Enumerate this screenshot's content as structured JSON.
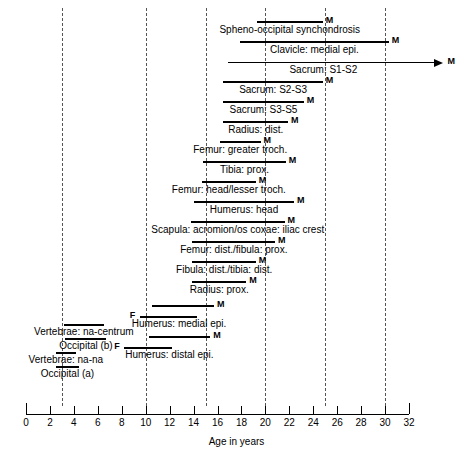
{
  "chart_data": {
    "type": "bar",
    "title": "",
    "xlabel": "Age in years",
    "ylabel": "",
    "xlim": [
      0,
      32
    ],
    "xticks": [
      0,
      2,
      4,
      6,
      8,
      10,
      12,
      14,
      16,
      18,
      20,
      22,
      24,
      26,
      28,
      30,
      32
    ],
    "xtick_labels": [
      "0",
      "2",
      "4",
      "6",
      "8",
      "10",
      "12",
      "14",
      "16",
      "18",
      "20",
      "22",
      "24",
      "26",
      "28",
      "30",
      "32"
    ],
    "gridlines": [
      3,
      10,
      15,
      20,
      25,
      30
    ],
    "grid": "dashed-vertical",
    "legend": [],
    "orientation": "horizontal-ranges",
    "series": [
      {
        "label": "Spheno-occipital synchondrosis",
        "sex": "M",
        "start": 19.3,
        "end": 24.8,
        "marker": "M",
        "open_ended": false,
        "label_align": "center"
      },
      {
        "label": "Clavicle: medial epi.",
        "sex": "M",
        "start": 17.9,
        "end": 30.3,
        "marker": "M",
        "open_ended": false,
        "label_align": "center"
      },
      {
        "label": "Sacrum: S1-S2",
        "sex": "M",
        "start": 16.9,
        "end": 34.8,
        "marker": "M",
        "open_ended": true,
        "label_align": "center"
      },
      {
        "label": "Sacrum: S2-S3",
        "sex": "M",
        "start": 16.5,
        "end": 24.8,
        "marker": "M",
        "open_ended": false,
        "label_align": "center"
      },
      {
        "label": "Sacrum: S3-S5",
        "sex": "M",
        "start": 16.5,
        "end": 23.2,
        "marker": "M",
        "open_ended": false,
        "label_align": "center"
      },
      {
        "label": "Radius: dist.",
        "sex": "M",
        "start": 16.5,
        "end": 21.9,
        "marker": "M",
        "open_ended": false,
        "label_align": "center"
      },
      {
        "label": "Femur: greater troch.",
        "sex": "M",
        "start": 16.2,
        "end": 19.6,
        "marker": "M",
        "open_ended": false,
        "label_align": "center"
      },
      {
        "label": "Tibia: prox.",
        "sex": "M",
        "start": 14.8,
        "end": 21.7,
        "marker": "M",
        "open_ended": false,
        "label_align": "center"
      },
      {
        "label": "Femur: head/lesser troch.",
        "sex": "M",
        "start": 14.7,
        "end": 19.2,
        "marker": "M",
        "open_ended": false,
        "label_align": "center"
      },
      {
        "label": "Humerus: head",
        "sex": "M",
        "start": 14.0,
        "end": 22.4,
        "marker": "M",
        "open_ended": false,
        "label_align": "center"
      },
      {
        "label": "Scapula: acromion/os coxae: iliac crest",
        "sex": "M",
        "start": 13.8,
        "end": 21.6,
        "marker": "M",
        "open_ended": false,
        "label_align": "center"
      },
      {
        "label": "Femur: dist./fibula: prox.",
        "sex": "M",
        "start": 13.9,
        "end": 20.8,
        "marker": "M",
        "open_ended": false,
        "label_align": "center"
      },
      {
        "label": "Fibula: dist./tibia: dist.",
        "sex": "M",
        "start": 13.9,
        "end": 19.2,
        "marker": "M",
        "open_ended": false,
        "label_align": "center"
      },
      {
        "label": "Radius: prox.",
        "sex": "M",
        "start": 13.9,
        "end": 18.4,
        "marker": "M",
        "open_ended": false,
        "label_align": "center"
      }
    ],
    "paired_series": [
      {
        "label": "Humerus: medial epi.",
        "male": {
          "start": 10.5,
          "end": 15.7,
          "marker": "M"
        },
        "female": {
          "start": 9.5,
          "end": 14.3,
          "marker": "F"
        }
      },
      {
        "label": "Humerus: distal epi.",
        "male": {
          "start": 10.3,
          "end": 15.4,
          "marker": "M"
        },
        "female": {
          "start": 8.2,
          "end": 12.2,
          "marker": "F"
        }
      }
    ],
    "unsexed_series": [
      {
        "label": "Vertebrae: na-centrum",
        "start": 3.2,
        "end": 6.5,
        "marker": ""
      },
      {
        "label": "Occipital (b)",
        "start": 3.3,
        "end": 6.7,
        "marker": ""
      },
      {
        "label": "Vertebrae: na-na",
        "start": 2.5,
        "end": 4.2,
        "marker": ""
      },
      {
        "label": "Occipital (a)",
        "start": 2.5,
        "end": 4.4,
        "marker": ""
      }
    ]
  },
  "axis": {
    "title": "Age in years",
    "tick_labels": [
      "0",
      "2",
      "4",
      "6",
      "8",
      "10",
      "12",
      "14",
      "16",
      "18",
      "20",
      "22",
      "24",
      "26",
      "28",
      "30",
      "32"
    ]
  },
  "markers": {
    "male": "M",
    "female": "F"
  },
  "colors": {
    "bar": "#000000",
    "gridline": "#555555",
    "axis": "#000000",
    "background": "#ffffff"
  }
}
